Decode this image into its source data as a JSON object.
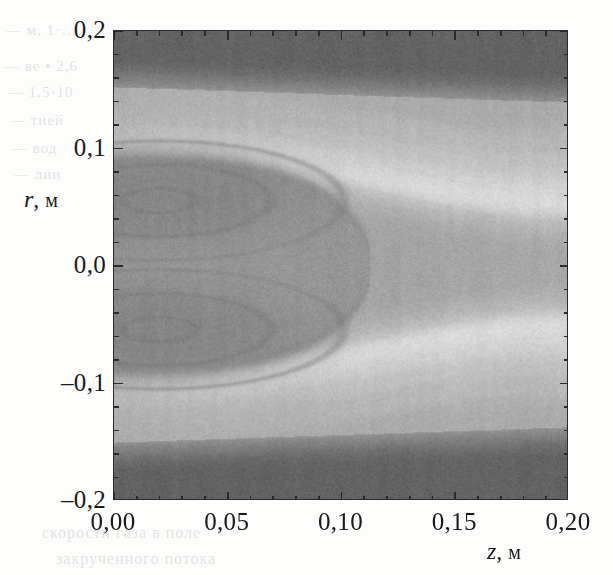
{
  "figure": {
    "kind": "grayscale-contour-field"
  },
  "axes": {
    "x": {
      "symbol": "z",
      "unit": "м",
      "label": "z, м",
      "min": 0.0,
      "max": 0.2,
      "major_ticks": [
        0.0,
        0.05,
        0.1,
        0.15,
        0.2
      ],
      "tick_labels": [
        "0,00",
        "0,05",
        "0,10",
        "0,15",
        "0,20"
      ],
      "minor_per_major": 5
    },
    "y": {
      "symbol": "r",
      "unit": "м",
      "label": "r, м",
      "min": -0.2,
      "max": 0.2,
      "major_ticks": [
        0.2,
        0.1,
        0.0,
        -0.1,
        -0.2
      ],
      "tick_labels": [
        "0,2",
        "0,1",
        "0,0",
        "–0,1",
        "–0,2"
      ],
      "minor_per_major": 5
    }
  },
  "colors": {
    "frame": "#2b2b2b",
    "paper": "#fdfdfc",
    "band_dark": "#6f6f6f",
    "field_mid": "#b9b9b9",
    "field_light": "#cfcfcf",
    "field_bright": "#e8e8e8",
    "bubble": "#a8a8a8",
    "core": "#9a9a9a"
  },
  "bleed_through": [
    {
      "text": "— м, 1·…",
      "x": 6,
      "y": 22,
      "size": 15
    },
    {
      "text": "— ве • 2,6",
      "x": 4,
      "y": 58,
      "size": 15
    },
    {
      "text": "— 1,5·10",
      "x": 8,
      "y": 84,
      "size": 15
    },
    {
      "text": "— тией",
      "x": 10,
      "y": 112,
      "size": 15
    },
    {
      "text": "— вод",
      "x": 12,
      "y": 140,
      "size": 15
    },
    {
      "text": "— лии",
      "x": 14,
      "y": 166,
      "size": 15
    },
    {
      "text": "скорости газа в поле",
      "x": 42,
      "y": 524,
      "size": 16
    },
    {
      "text": "закрученного потока",
      "x": 56,
      "y": 550,
      "size": 16
    }
  ],
  "chart_data": {
    "type": "heatmap",
    "title": "",
    "subtitle": "",
    "xlabel": "z, м",
    "ylabel": "r, м",
    "xlim": [
      0.0,
      0.2
    ],
    "ylim": [
      -0.2,
      0.2
    ],
    "grid": false,
    "legend": "none",
    "colormap": "grayscale",
    "colorbar": false,
    "value_range_note": "relative field intensity, unlabeled (0 = dark, 1 = bright)",
    "annotations": [],
    "features": [
      {
        "name": "upper-wall-dark-band",
        "type": "band",
        "shade": 0.18,
        "r_top": 0.2,
        "r_bottom_at_z0": 0.152,
        "r_bottom_at_z020": 0.14,
        "note": "dark boundary band hugging the upper wall, thickening slightly with z"
      },
      {
        "name": "lower-wall-dark-band",
        "type": "band",
        "shade": 0.18,
        "r_bottom": -0.2,
        "r_top_at_z0": -0.15,
        "r_top_at_z020": -0.14,
        "note": "dark boundary band hugging the lower wall, mirror of upper"
      },
      {
        "name": "recirculation-bubble",
        "type": "closed-region",
        "shade": 0.45,
        "z_range": [
          0.0,
          0.115
        ],
        "r_range": [
          -0.085,
          0.095
        ],
        "nose_z": 0.113,
        "note": "central recirculation bubble reaching to about z = 0.11 m"
      },
      {
        "name": "upper-vortex-core",
        "type": "closed-contour-nest",
        "shade": 0.36,
        "center_z": 0.02,
        "center_r": 0.055,
        "rings": 5
      },
      {
        "name": "lower-vortex-core",
        "type": "closed-contour-nest",
        "shade": 0.36,
        "center_z": 0.02,
        "center_r": -0.055,
        "rings": 5
      },
      {
        "name": "upper-shear-layer",
        "type": "bright-band-set",
        "shade": 0.9,
        "path": "from (0.00, 0.105) sloping down to (0.20, 0.050)",
        "count": 4
      },
      {
        "name": "lower-shear-layer",
        "type": "bright-band-set",
        "shade": 0.9,
        "path": "from (0.00, -0.108) sloping up to (0.20, -0.050)",
        "count": 4
      }
    ],
    "field_profiles": {
      "comment": "Representative r-profiles of the normalized field value sampled at several z stations.",
      "r_samples": [
        0.2,
        0.18,
        0.16,
        0.14,
        0.12,
        0.1,
        0.08,
        0.06,
        0.04,
        0.02,
        0.0,
        -0.02,
        -0.04,
        -0.06,
        -0.08,
        -0.1,
        -0.12,
        -0.14,
        -0.16,
        -0.18,
        -0.2
      ],
      "stations": [
        {
          "z": 0.0,
          "values": [
            0.18,
            0.16,
            0.22,
            0.58,
            0.66,
            0.72,
            0.55,
            0.42,
            0.47,
            0.5,
            0.52,
            0.5,
            0.47,
            0.42,
            0.55,
            0.74,
            0.7,
            0.58,
            0.22,
            0.16,
            0.18
          ]
        },
        {
          "z": 0.05,
          "values": [
            0.17,
            0.15,
            0.2,
            0.56,
            0.66,
            0.7,
            0.5,
            0.38,
            0.44,
            0.48,
            0.5,
            0.48,
            0.44,
            0.38,
            0.5,
            0.7,
            0.68,
            0.56,
            0.2,
            0.15,
            0.17
          ]
        },
        {
          "z": 0.1,
          "values": [
            0.17,
            0.15,
            0.19,
            0.55,
            0.65,
            0.78,
            0.8,
            0.58,
            0.48,
            0.5,
            0.52,
            0.5,
            0.48,
            0.58,
            0.8,
            0.78,
            0.66,
            0.55,
            0.19,
            0.15,
            0.17
          ]
        },
        {
          "z": 0.15,
          "values": [
            0.16,
            0.14,
            0.18,
            0.54,
            0.64,
            0.72,
            0.86,
            0.9,
            0.68,
            0.58,
            0.56,
            0.58,
            0.68,
            0.9,
            0.86,
            0.72,
            0.64,
            0.54,
            0.18,
            0.14,
            0.16
          ]
        },
        {
          "z": 0.2,
          "values": [
            0.16,
            0.14,
            0.17,
            0.53,
            0.63,
            0.7,
            0.8,
            0.92,
            0.86,
            0.66,
            0.58,
            0.66,
            0.86,
            0.92,
            0.8,
            0.7,
            0.63,
            0.53,
            0.17,
            0.14,
            0.16
          ]
        }
      ]
    }
  }
}
